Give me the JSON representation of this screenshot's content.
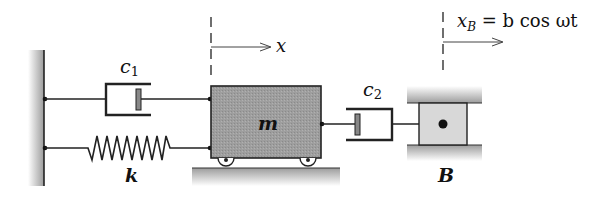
{
  "diagram": {
    "type": "mass-spring-damper system",
    "labels": {
      "damper1": "c",
      "damper1_sub": "1",
      "spring": "k",
      "mass": "m",
      "damper2": "c",
      "damper2_sub": "2",
      "block": "B",
      "mass_coord": "x",
      "block_motion_var": "x",
      "block_motion_sub": "B",
      "block_motion_eq": " = b cos ωt"
    },
    "components": [
      {
        "id": "wall",
        "kind": "fixed-support"
      },
      {
        "id": "c1",
        "kind": "damper",
        "connects": [
          "wall",
          "m"
        ]
      },
      {
        "id": "k",
        "kind": "spring",
        "connects": [
          "wall",
          "m"
        ]
      },
      {
        "id": "m",
        "kind": "mass-on-wheels"
      },
      {
        "id": "c2",
        "kind": "damper",
        "connects": [
          "m",
          "B"
        ]
      },
      {
        "id": "B",
        "kind": "driven-block",
        "motion": "x_B = b cos ωt"
      }
    ],
    "colors": {
      "line": "#222222",
      "mass_fill": "#9a9a9a",
      "block_fill": "#d6d6d6",
      "hatch": "#bdbdbd"
    }
  }
}
